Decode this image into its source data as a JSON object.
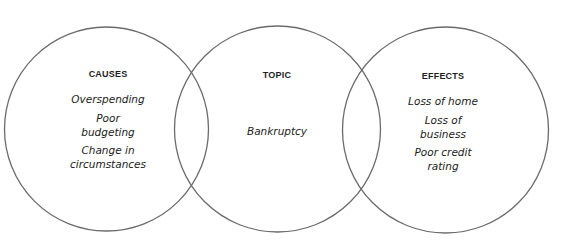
{
  "diagram": {
    "type": "three-circle venn / cause-effect organizer",
    "stroke_color": "#6b6b6b",
    "text_color": "#222222",
    "circles": [
      {
        "id": "causes",
        "heading": "CAUSES",
        "items": [
          "Overspending",
          "Poor",
          "budgeting",
          "Change in",
          "circumstances"
        ],
        "entries": [
          "Overspending",
          "Poor budgeting",
          "Change in circumstances"
        ]
      },
      {
        "id": "topic",
        "heading": "TOPIC",
        "items": [
          "Bankruptcy"
        ],
        "entries": [
          "Bankruptcy"
        ]
      },
      {
        "id": "effects",
        "heading": "EFFECTS",
        "items": [
          "Loss of home",
          "Loss of",
          "business",
          "Poor credit",
          "rating"
        ],
        "entries": [
          "Loss of home",
          "Loss of business",
          "Poor credit rating"
        ]
      }
    ]
  }
}
